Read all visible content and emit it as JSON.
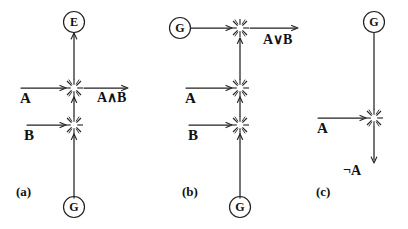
{
  "figure": {
    "kind": "hand-drawn-logic-circuit-diagram",
    "background_color": "#ffffff",
    "ink_color": "#222222",
    "width": 408,
    "height": 229
  },
  "panels": [
    {
      "id": "a",
      "caption": "(a)",
      "gate": "AND",
      "nodes": [
        {
          "name": "source-e",
          "label": "E",
          "x": 74,
          "y": 22
        },
        {
          "name": "source-g",
          "label": "G",
          "x": 74,
          "y": 207
        }
      ],
      "inputs": [
        {
          "name": "input-a",
          "label": "A",
          "x": 26,
          "y": 97
        },
        {
          "name": "input-b",
          "label": "B",
          "x": 30,
          "y": 133
        }
      ],
      "output": {
        "name": "output-and",
        "label": "A∧B",
        "operand_left": "A",
        "operator": "∧",
        "operand_right": "B",
        "x": 102,
        "y": 97
      }
    },
    {
      "id": "b",
      "caption": "(b)",
      "gate": "OR",
      "nodes": [
        {
          "name": "source-g-left",
          "label": "G",
          "x": 180,
          "y": 28
        },
        {
          "name": "source-g-bottom",
          "label": "G",
          "x": 240,
          "y": 207
        }
      ],
      "inputs": [
        {
          "name": "input-a",
          "label": "A",
          "x": 190,
          "y": 97
        },
        {
          "name": "input-b",
          "label": "B",
          "x": 192,
          "y": 133
        }
      ],
      "output": {
        "name": "output-or",
        "label": "A∨B",
        "operand_left": "A",
        "operator": "∨",
        "operand_right": "B",
        "x": 268,
        "y": 40
      }
    },
    {
      "id": "c",
      "caption": "(c)",
      "gate": "NOT",
      "nodes": [
        {
          "name": "source-g-top",
          "label": "G",
          "x": 374,
          "y": 22
        }
      ],
      "inputs": [
        {
          "name": "input-a",
          "label": "A",
          "x": 322,
          "y": 127
        }
      ],
      "output": {
        "name": "output-not",
        "label": "¬A",
        "operator": "¬",
        "operand_right": "A",
        "x": 348,
        "y": 170
      }
    }
  ],
  "captions": {
    "a": "(a)",
    "b": "(b)",
    "c": "(c)"
  },
  "labels": {
    "node_e": "E",
    "node_g": "G",
    "input_a": "A",
    "input_b": "B",
    "output_and": "A∧B",
    "output_or": "A∨B",
    "output_not": "¬A"
  },
  "symbols": {
    "junction": "spark-starburst",
    "and_operator": "∧",
    "or_operator": "∨",
    "not_operator": "¬"
  }
}
